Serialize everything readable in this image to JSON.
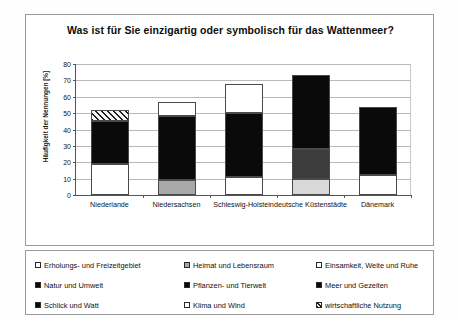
{
  "chart_data": {
    "type": "bar",
    "stacked": true,
    "title": "Was ist für Sie einzigartig oder symbolisch für das Wattenmeer?",
    "xlabel": "",
    "ylabel": "Häufigkeit der Nennungen [%]",
    "ylim": [
      0,
      80
    ],
    "yticks": [
      0,
      10,
      20,
      30,
      40,
      50,
      60,
      70,
      80
    ],
    "grid": true,
    "legend_position": "bottom",
    "categories": [
      "Niederlande",
      "Niedersachsen",
      "Schleswig-Holstein",
      "deutsche Küstenstädte",
      "Dänemark"
    ],
    "series": [
      {
        "name": "Erholungs- und Freizeitgebiet",
        "pattern": "white",
        "values": [
          19,
          0,
          11,
          0,
          12
        ]
      },
      {
        "name": "Heimat und Lebensraum",
        "pattern": "gray",
        "values": [
          0,
          9,
          0,
          0,
          0
        ]
      },
      {
        "name": "Einsamkeit, Weite und Ruhe",
        "pattern": "white",
        "values": [
          0,
          0,
          0,
          0,
          0
        ]
      },
      {
        "name": "Natur und Umwelt",
        "pattern": "black",
        "values": [
          26,
          39,
          39,
          0,
          42
        ]
      },
      {
        "name": "Pflanzen- und Tierwelt",
        "pattern": "darkgray",
        "values": [
          0,
          0,
          0,
          18,
          0
        ]
      },
      {
        "name": "Meer und Gezeiten",
        "pattern": "black",
        "values": [
          0,
          0,
          0,
          45,
          0
        ]
      },
      {
        "name": "Schlick und Watt",
        "pattern": "lightgray",
        "values": [
          0,
          0,
          0,
          10,
          0
        ]
      },
      {
        "name": "Klima und Wind",
        "pattern": "white",
        "values": [
          0,
          9,
          18,
          0,
          0
        ]
      },
      {
        "name": "wirtschaftliche Nutzung",
        "pattern": "hatch",
        "values": [
          7,
          0,
          0,
          0,
          0
        ]
      }
    ],
    "bars": [
      {
        "category": "Niederlande",
        "total": 52,
        "segments": [
          {
            "label": "Erholungs- und Freizeitgebiet",
            "pattern": "white",
            "from": 0,
            "to": 19
          },
          {
            "label": "Natur und Umwelt",
            "pattern": "black",
            "from": 19,
            "to": 45
          },
          {
            "label": "wirtschaftliche Nutzung",
            "pattern": "hatch",
            "from": 45,
            "to": 52
          }
        ]
      },
      {
        "category": "Niedersachsen",
        "total": 57,
        "segments": [
          {
            "label": "Heimat und Lebensraum",
            "pattern": "gray",
            "from": 0,
            "to": 9
          },
          {
            "label": "Natur und Umwelt",
            "pattern": "black",
            "from": 9,
            "to": 48
          },
          {
            "label": "Klima und Wind",
            "pattern": "white",
            "from": 48,
            "to": 57
          }
        ]
      },
      {
        "category": "Schleswig-Holstein",
        "total": 68,
        "segments": [
          {
            "label": "Erholungs- und Freizeitgebiet",
            "pattern": "white",
            "from": 0,
            "to": 11
          },
          {
            "label": "Natur und Umwelt",
            "pattern": "black",
            "from": 11,
            "to": 50
          },
          {
            "label": "Klima und Wind",
            "pattern": "white",
            "from": 50,
            "to": 68
          }
        ]
      },
      {
        "category": "deutsche Küstenstädte",
        "total": 73,
        "segments": [
          {
            "label": "Schlick und Watt",
            "pattern": "lightgray",
            "from": 0,
            "to": 10
          },
          {
            "label": "Pflanzen- und Tierwelt",
            "pattern": "darkgray",
            "from": 10,
            "to": 28
          },
          {
            "label": "Meer und Gezeiten",
            "pattern": "black",
            "from": 28,
            "to": 73
          }
        ]
      },
      {
        "category": "Dänemark",
        "total": 54,
        "segments": [
          {
            "label": "Erholungs- und Freizeitgebiet",
            "pattern": "white",
            "from": 0,
            "to": 12
          },
          {
            "label": "Natur und Umwelt",
            "pattern": "black",
            "from": 12,
            "to": 54
          }
        ]
      }
    ]
  },
  "legend": {
    "entries": [
      {
        "label": "Erholungs- und Freizeitgebiet",
        "pattern": "white"
      },
      {
        "label": "Heimat und Lebensraum",
        "pattern": "gray"
      },
      {
        "label": "Einsamkeit, Weite und Ruhe",
        "pattern": "white"
      },
      {
        "label": "Natur und Umwelt",
        "pattern": "black"
      },
      {
        "label": "Pflanzen- und Tierwelt",
        "pattern": "black"
      },
      {
        "label": "Meer und Gezeiten",
        "pattern": "black"
      },
      {
        "label": "Schlick und Watt",
        "pattern": "black"
      },
      {
        "label": "Klima und Wind",
        "pattern": "white"
      },
      {
        "label": "wirtschaftliche Nutzung",
        "pattern": "hatch"
      }
    ]
  }
}
